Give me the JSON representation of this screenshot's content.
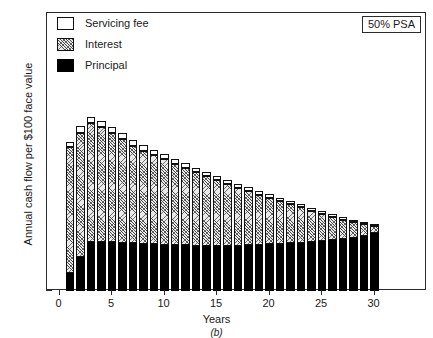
{
  "chart_data": {
    "type": "bar",
    "title": "",
    "subtitle": "",
    "panel_label": "(b)",
    "xlabel": "Years",
    "ylabel": "Annual cash flow per $100 face value",
    "xlim": [
      -1.2,
      35.0
    ],
    "ylim": [
      0,
      20
    ],
    "xticks": [
      0,
      5,
      10,
      15,
      20,
      25,
      30
    ],
    "yticks": [
      0,
      5,
      10,
      15,
      20
    ],
    "grid": false,
    "stacked": true,
    "legend_position": "upper-left",
    "annotation": "50% PSA",
    "categories": [
      1,
      2,
      3,
      4,
      5,
      6,
      7,
      8,
      9,
      10,
      11,
      12,
      13,
      14,
      15,
      16,
      17,
      18,
      19,
      20,
      21,
      22,
      23,
      24,
      25,
      26,
      27,
      28,
      29,
      30
    ],
    "series": [
      {
        "name": "Principal",
        "color": "#000000",
        "pattern": "solid",
        "values": [
          1.3,
          2.45,
          3.5,
          3.55,
          3.5,
          3.48,
          3.45,
          3.38,
          3.35,
          3.32,
          3.3,
          3.28,
          3.27,
          3.26,
          3.26,
          3.26,
          3.27,
          3.3,
          3.33,
          3.36,
          3.4,
          3.44,
          3.48,
          3.52,
          3.58,
          3.64,
          3.72,
          3.84,
          3.98,
          4.18
        ]
      },
      {
        "name": "Interest",
        "color": "#e9e9e9",
        "pattern": "hatched",
        "values": [
          9.05,
          8.95,
          8.6,
          8.25,
          7.85,
          7.45,
          7.0,
          6.72,
          6.45,
          6.15,
          5.85,
          5.55,
          5.27,
          5.0,
          4.72,
          4.46,
          4.16,
          3.87,
          3.6,
          3.33,
          3.07,
          2.8,
          2.54,
          2.26,
          1.98,
          1.7,
          1.42,
          1.12,
          0.82,
          0.5
        ]
      },
      {
        "name": "Servicing fee",
        "color": "#ffffff",
        "pattern": "empty",
        "values": [
          0.4,
          0.45,
          0.45,
          0.45,
          0.45,
          0.42,
          0.4,
          0.4,
          0.38,
          0.38,
          0.35,
          0.35,
          0.33,
          0.32,
          0.32,
          0.3,
          0.28,
          0.28,
          0.27,
          0.26,
          0.25,
          0.24,
          0.23,
          0.22,
          0.21,
          0.2,
          0.19,
          0.18,
          0.17,
          0.15
        ]
      }
    ],
    "totals": [
      10.75,
      11.85,
      12.55,
      12.25,
      11.8,
      11.35,
      10.85,
      10.5,
      10.18,
      9.85,
      9.5,
      9.18,
      8.87,
      8.58,
      8.3,
      8.02,
      7.71,
      7.45,
      7.2,
      6.95,
      6.72,
      6.48,
      6.25,
      6.0,
      5.77,
      5.54,
      5.33,
      5.14,
      4.97,
      4.83
    ]
  },
  "legend": {
    "items": [
      {
        "label": "Servicing fee",
        "swatch": "swatch-empty-icon"
      },
      {
        "label": "Interest",
        "swatch": "swatch-hatched-icon"
      },
      {
        "label": "Principal",
        "swatch": "swatch-solid-icon"
      }
    ]
  }
}
